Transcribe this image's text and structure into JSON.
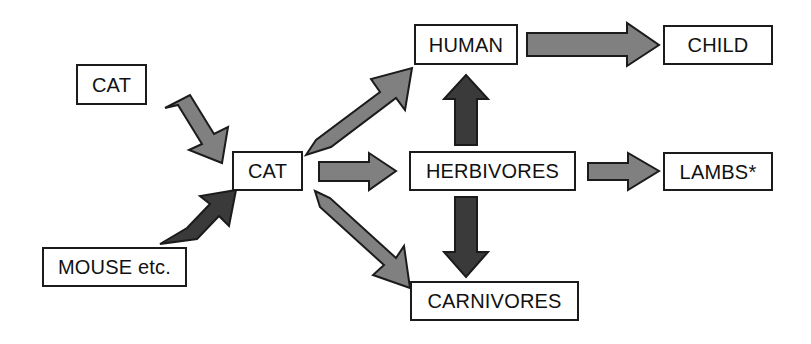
{
  "diagram": {
    "background_color": "#ffffff",
    "colors": {
      "box_border": "#1b1b1b",
      "box_fill": "#ffffff",
      "text": "#111111",
      "arrow_gray": "#808080",
      "arrow_dark": "#3a3a3a",
      "arrow_outline": "#1b1b1b"
    },
    "nodes": [
      {
        "id": "cat_source",
        "label": "CAT",
        "x": 76,
        "y": 64,
        "width": 71,
        "height": 41
      },
      {
        "id": "mouse_source",
        "label": "MOUSE etc.",
        "x": 42,
        "y": 247,
        "width": 145,
        "height": 40
      },
      {
        "id": "cat_center",
        "label": "CAT",
        "x": 232,
        "y": 151,
        "width": 71,
        "height": 40
      },
      {
        "id": "human",
        "label": "HUMAN",
        "x": 414,
        "y": 24,
        "width": 104,
        "height": 41
      },
      {
        "id": "child",
        "label": "CHILD",
        "x": 663,
        "y": 25,
        "width": 110,
        "height": 40
      },
      {
        "id": "herbivores",
        "label": "HERBIVORES",
        "x": 409,
        "y": 151,
        "width": 167,
        "height": 40
      },
      {
        "id": "lambs",
        "label": "LAMBS*",
        "x": 663,
        "y": 152,
        "width": 110,
        "height": 39
      },
      {
        "id": "carnivores",
        "label": "CARNIVORES",
        "x": 410,
        "y": 281,
        "width": 169,
        "height": 40
      }
    ],
    "arrows": [
      {
        "id": "cat-to-catcenter",
        "from": "cat_source",
        "to": "cat_center",
        "style": "gray",
        "direction": "down-right"
      },
      {
        "id": "mouse-to-catcenter",
        "from": "mouse_source",
        "to": "cat_center",
        "style": "dark",
        "direction": "up-right"
      },
      {
        "id": "catcenter-to-human",
        "from": "cat_center",
        "to": "human",
        "style": "gray",
        "direction": "up-right"
      },
      {
        "id": "catcenter-to-herbivores",
        "from": "cat_center",
        "to": "herbivores",
        "style": "gray",
        "direction": "right"
      },
      {
        "id": "catcenter-to-carnivores",
        "from": "cat_center",
        "to": "carnivores",
        "style": "gray",
        "direction": "down-right"
      },
      {
        "id": "human-to-child",
        "from": "human",
        "to": "child",
        "style": "gray",
        "direction": "right"
      },
      {
        "id": "herbivores-to-human",
        "from": "herbivores",
        "to": "human",
        "style": "dark",
        "direction": "up"
      },
      {
        "id": "herbivores-to-lambs",
        "from": "herbivores",
        "to": "lambs",
        "style": "gray",
        "direction": "right"
      },
      {
        "id": "herbivores-to-carnivores",
        "from": "herbivores",
        "to": "carnivores",
        "style": "dark",
        "direction": "down"
      }
    ]
  }
}
